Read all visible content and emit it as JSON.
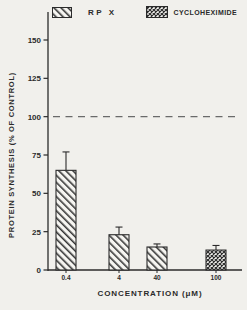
{
  "figure": {
    "background": "#f1f0ec",
    "ink": "#2b2b2b",
    "reference_line_color": "#6a6a6a"
  },
  "legend": {
    "items": [
      {
        "label": "RP X",
        "pattern": "diagonal-hatch"
      },
      {
        "label": "CYCLOHEXIMIDE",
        "pattern": "crosshatch"
      }
    ]
  },
  "chart_data": {
    "type": "bar",
    "title": "",
    "xlabel": "CONCENTRATION (μM)",
    "ylabel": "PROTEIN SYNTHESIS (% OF CONTROL)",
    "categories": [
      "0.4",
      "4",
      "40",
      "100"
    ],
    "values": [
      65,
      23,
      15,
      13
    ],
    "errors": [
      12,
      5,
      2,
      3
    ],
    "series_by_bar": [
      "RP X",
      "RP X",
      "RP X",
      "CYCLOHEXIMIDE"
    ],
    "patterns_by_bar": [
      "diagonal-hatch",
      "diagonal-hatch",
      "diagonal-hatch",
      "crosshatch"
    ],
    "yticks": [
      0,
      25,
      50,
      75,
      100,
      125,
      150
    ],
    "ylim": [
      0,
      150
    ],
    "reference_line": {
      "y": 100,
      "style": "dashed"
    },
    "grid": false,
    "legend_position": "top"
  }
}
